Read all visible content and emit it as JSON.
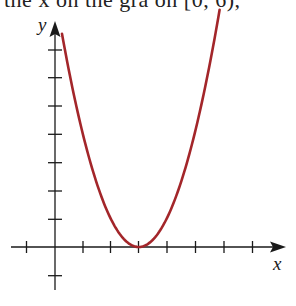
{
  "caption_partial": "the x  on the gra  on  [0, 6),",
  "colors": {
    "curve": "#a3262a",
    "axis": "#1a1a1a",
    "background": "#ffffff"
  },
  "chart_data": {
    "type": "line",
    "title": "",
    "function": "y = (x - 3)^2",
    "xlabel": "x",
    "ylabel": "y",
    "xlim": [
      -1.6,
      8.3
    ],
    "ylim": [
      -1.5,
      8.0
    ],
    "x_ticks": [
      -1,
      1,
      2,
      3,
      4,
      5,
      6,
      7
    ],
    "y_ticks": [
      -1,
      1,
      2,
      3,
      4,
      5,
      6,
      7
    ],
    "tick_labels_shown": false,
    "grid": false,
    "legend": null,
    "series": [
      {
        "name": "parabola",
        "color": "#a3262a",
        "x": [
          0.25,
          0.5,
          1,
          1.5,
          2,
          2.5,
          3,
          3.5,
          4,
          4.5,
          5,
          5.5,
          5.9
        ],
        "y": [
          7.56,
          6.25,
          4,
          2.25,
          1,
          0.25,
          0,
          0.25,
          1,
          2.25,
          4,
          6.25,
          8.41
        ]
      }
    ],
    "vertex": [
      3,
      0
    ]
  }
}
